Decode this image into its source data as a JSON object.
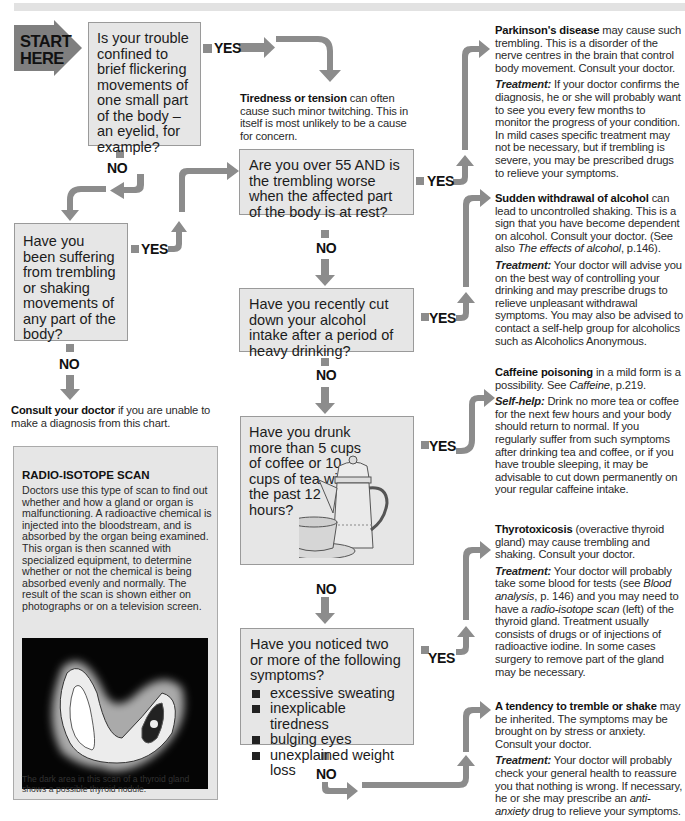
{
  "start": {
    "line1": "START",
    "line2": "HERE"
  },
  "labels": {
    "yes": "YES",
    "no": "NO"
  },
  "questions": [
    {
      "id": "q1",
      "text": "Is your trouble confined to brief flickering movements of one small part of the body – an eyelid, for example?"
    },
    {
      "id": "q2",
      "text": "Have you been suffering from trembling or shaking movements of any part of the body?"
    },
    {
      "id": "q3",
      "text": "Are you over 55 AND is the trembling worse when the affected part of the body is at rest?"
    },
    {
      "id": "q4",
      "text": "Have you recently cut down your alcohol intake after a period of heavy drinking?"
    },
    {
      "id": "q5",
      "text": "Have you drunk more than 5 cups of coffee or 10 cups of tea within the past 12 hours?"
    },
    {
      "id": "q6",
      "text": "Have you noticed two or more of the following symptoms?",
      "bullets": [
        "excessive sweating",
        "inexplicable tiredness",
        "bulging eyes",
        "unexplained weight loss"
      ]
    }
  ],
  "outcomes": {
    "tiredness": {
      "title": "Tiredness or tension",
      "text": " can often cause such minor twitching. This in itself is most unlikely to be a cause for concern."
    },
    "consult": {
      "title": "Consult your doctor",
      "text": " if you are unable to make a diagnosis from this chart."
    },
    "parkinsons": {
      "title": "Parkinson's disease",
      "text": " may cause such trembling. This is a disorder of the nerve centres in the brain that control body movement. Consult your doctor.",
      "t_label": "Treatment:",
      "t_text": " If your doctor confirms the diagnosis, he or she will probably want to see you every few months to monitor the progress of your condition. In mild cases specific treatment may not be necessary, but if trembling is severe, you may be prescribed drugs to relieve your symptoms."
    },
    "alcohol": {
      "title": "Sudden withdrawal of alcohol",
      "text": " can lead to uncontrolled shaking. This is a sign that you have become dependent on alcohol. Consult your doctor. (See also ",
      "ref": "The effects of alcohol",
      "ref_page": ", p.146).",
      "t_label": "Treatment:",
      "t_text": " Your doctor will advise you on the best way of controlling your drinking and may prescribe drugs to relieve unpleasant withdrawal symptoms. You may also be advised to contact a self-help group for alcoholics such as Alcoholics Anonymous."
    },
    "caffeine": {
      "title": "Caffeine poisoning",
      "text": " in a mild form is a possibility. See ",
      "ref": "Caffeine",
      "ref_page": ", p.219.",
      "t_label": "Self-help:",
      "t_text": " Drink no more tea or coffee for the next few hours and your body should return to normal. If you regularly suffer from such symptoms after drinking tea and coffee, or if you have trouble sleeping, it may be advisable to cut down permanently on your regular caffeine intake."
    },
    "thyro": {
      "title": "Thyrotoxicosis",
      "text": " (overactive thyroid gland) may cause trembling and shaking. Consult your doctor.",
      "t_label": "Treatment:",
      "t_text1": " Your doctor will probably take some blood for tests (see ",
      "ref1": "Blood analysis",
      "t_text2": ", p. 146) and you may need to have a ",
      "ref2": "radio-isotope scan",
      "t_text3": " (left) of the thyroid gland. Treatment usually consists of drugs or of injections of radioactive iodine. In some cases surgery to remove part of the gland may be necessary."
    },
    "tendency": {
      "title": "A tendency to tremble or shake",
      "text": " may be inherited. The symptoms may be brought on by stress or anxiety. Consult your doctor.",
      "t_label": "Treatment:",
      "t_text1": " Your doctor will probably check your general health to reassure you that nothing is wrong. If necessary, he or she may prescribe an ",
      "ref": "anti-anxiety",
      "t_text2": " drug to relieve your symptoms."
    }
  },
  "sidebar": {
    "title": "RADIO-ISOTOPE SCAN",
    "body": "Doctors use this type of scan to find out whether and how a gland or organ is malfunctioning. A radioactive chemical is injected into the bloodstream, and is absorbed by the organ being examined. This organ is then scanned with specialized equipment, to determine whether or not the chemical is being absorbed evenly and normally. The result of the scan is shown either on photographs or on a television screen.",
    "caption": "The dark area in this scan of a thyroid gland shows a possible thyroid nodule."
  },
  "colors": {
    "box_fill": "#e6e6e6",
    "arrow": "#8c8c8c",
    "start": "#7f7f7f"
  }
}
